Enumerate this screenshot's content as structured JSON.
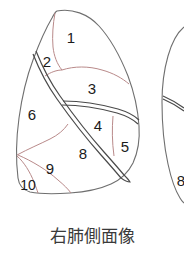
{
  "figure": {
    "caption": "右肺側面像",
    "colors": {
      "background": "#ffffff",
      "outline": "#6f6f6f",
      "fissure": "#4a4a4a",
      "segment_boundary": "#b98a8a",
      "label_text": "#1b1b1b",
      "caption_text": "#3a3a3a"
    },
    "main_diagram": {
      "name": "right-lung-lateral-view",
      "segment_labels": [
        {
          "id": "1",
          "text": "1",
          "x": 71,
          "y": 39
        },
        {
          "id": "2",
          "text": "2",
          "x": 47,
          "y": 63
        },
        {
          "id": "3",
          "text": "3",
          "x": 92,
          "y": 90
        },
        {
          "id": "4",
          "text": "4",
          "x": 98,
          "y": 127
        },
        {
          "id": "5",
          "text": "5",
          "x": 125,
          "y": 148
        },
        {
          "id": "6",
          "text": "6",
          "x": 32,
          "y": 116
        },
        {
          "id": "8",
          "text": "8",
          "x": 83,
          "y": 155
        },
        {
          "id": "9",
          "text": "9",
          "x": 50,
          "y": 170
        },
        {
          "id": "10",
          "text": "10",
          "x": 28,
          "y": 186
        }
      ]
    },
    "secondary_diagram": {
      "name": "left-lung-lateral-view-partial",
      "segment_labels": [
        {
          "id": "8b",
          "text": "8",
          "x": 181,
          "y": 182
        }
      ]
    }
  }
}
